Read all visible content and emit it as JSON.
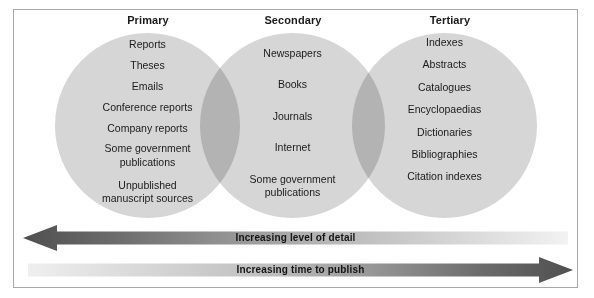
{
  "diagram": {
    "type": "venn-three-circle",
    "columns": [
      {
        "id": "primary",
        "header": "Primary",
        "items": [
          "Reports",
          "Theses",
          "Emails",
          "Conference reports",
          "Company reports",
          "Some government\npublications",
          "Unpublished\nmanuscript sources"
        ]
      },
      {
        "id": "secondary",
        "header": "Secondary",
        "items": [
          "Newspapers",
          "Books",
          "Journals",
          "Internet",
          "Some government\npublications"
        ]
      },
      {
        "id": "tertiary",
        "header": "Tertiary",
        "items": [
          "Indexes",
          "Abstracts",
          "Catalogues",
          "Encyclopaedias",
          "Dictionaries",
          "Bibliographies",
          "Citation indexes"
        ]
      }
    ],
    "arrows": [
      {
        "id": "detail",
        "label": "Increasing level of detail",
        "direction": "left",
        "gradient_from": "#595959",
        "gradient_to": "#f0f0f0"
      },
      {
        "id": "time",
        "label": "Increasing time to publish",
        "direction": "right",
        "gradient_from": "#ececec",
        "gradient_to": "#595959"
      }
    ],
    "colors": {
      "circle_fill": "#d6d6d6",
      "overlap_fill": "#b8b8b8",
      "border": "#a8a8a8",
      "text": "#1a1a1a",
      "background": "#ffffff"
    }
  }
}
